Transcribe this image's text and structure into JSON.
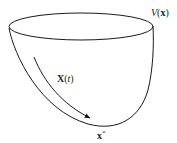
{
  "diagram": {
    "type": "lyapunov-bowl",
    "surface_label": "V(x)",
    "surface_label_parts": {
      "func": "V",
      "open": "(",
      "arg": "x",
      "close": ")"
    },
    "trajectory_label": "X(t)",
    "trajectory_label_parts": {
      "func": "X",
      "open": "(",
      "arg": "t",
      "close": ")"
    },
    "minimum_label": "x*",
    "minimum_label_parts": {
      "base": "x",
      "sup": "*"
    },
    "colors": {
      "stroke": "#1a1a1a",
      "background": "#ffffff"
    }
  }
}
